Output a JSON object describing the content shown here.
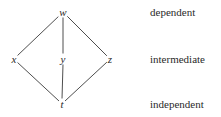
{
  "diagram": {
    "nodes": [
      {
        "id": "w",
        "label": "w",
        "x": 63,
        "y": 12
      },
      {
        "id": "x",
        "label": "x",
        "x": 14,
        "y": 59
      },
      {
        "id": "y",
        "label": "y",
        "x": 63,
        "y": 59
      },
      {
        "id": "z",
        "label": "z",
        "x": 110,
        "y": 59
      },
      {
        "id": "t",
        "label": "t",
        "x": 62,
        "y": 104
      }
    ],
    "edges": [
      [
        "w",
        "x"
      ],
      [
        "w",
        "y"
      ],
      [
        "w",
        "z"
      ],
      [
        "x",
        "t"
      ],
      [
        "y",
        "t"
      ],
      [
        "z",
        "t"
      ]
    ],
    "levels": [
      {
        "label": "dependent",
        "y": 12
      },
      {
        "label": "intermediate",
        "y": 59
      },
      {
        "label": "independent",
        "y": 104
      }
    ]
  }
}
